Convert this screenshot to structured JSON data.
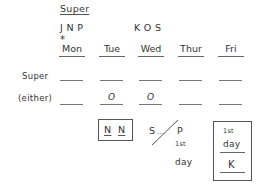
{
  "header": {
    "super_label": "Super",
    "group_left": "J N P",
    "group_right": "K O S",
    "asterisk": "*"
  },
  "days": [
    "Mon",
    "Tue",
    "Wed",
    "Thur",
    "Fri"
  ],
  "rows": [
    {
      "label": "Super",
      "slots": [
        "",
        "",
        "",
        "",
        ""
      ]
    },
    {
      "label": "(either)",
      "slots": [
        "",
        "O",
        "O",
        "",
        ""
      ]
    }
  ],
  "notes": {
    "box_nn": [
      "N",
      "N"
    ],
    "sp_left": "S",
    "sp_dots": "...",
    "sp_right": "P",
    "sp_first": "1st",
    "sp_day": "day",
    "box_right_first": "1st",
    "box_right_day": "day",
    "box_right_k": "K"
  }
}
